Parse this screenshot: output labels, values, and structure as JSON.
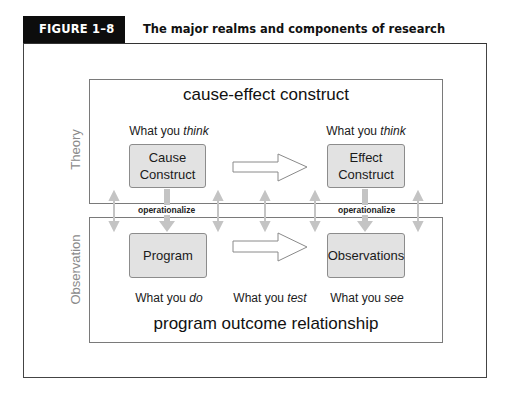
{
  "header": {
    "figure_label": "FIGURE 1–8",
    "title": "The major realms and components of research"
  },
  "theory_realm": {
    "side_label": "Theory",
    "title": "cause-effect construct",
    "left": {
      "caption_prefix": "What you ",
      "caption_emph": "think",
      "box_line1": "Cause",
      "box_line2": "Construct"
    },
    "right": {
      "caption_prefix": "What you ",
      "caption_emph": "think",
      "box_line1": "Effect",
      "box_line2": "Construct"
    }
  },
  "link": {
    "left_label": "operationalize",
    "right_label": "operationalize"
  },
  "observation_realm": {
    "side_label": "Observation",
    "title": "program outcome relationship",
    "left": {
      "box_label": "Program",
      "caption_prefix": "What you ",
      "caption_emph": "do"
    },
    "middle": {
      "caption_prefix": "What you ",
      "caption_emph": "test"
    },
    "right": {
      "box_label": "Observations",
      "caption_prefix": "What you ",
      "caption_emph": "see"
    }
  },
  "colors": {
    "header_bg": "#0d0d0d",
    "box_fill": "#e2e2e2",
    "arrow_gray": "#c4c4c4",
    "side_label": "#8a8a8a"
  }
}
